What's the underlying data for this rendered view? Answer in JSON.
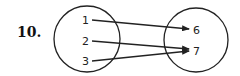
{
  "problem_number": "10.",
  "domain_set": {
    "elements": [
      "1",
      "2",
      "3"
    ]
  },
  "range_set": {
    "elements": [
      "6",
      "7"
    ]
  },
  "mapping": [
    {
      "from": "1",
      "to": "6"
    },
    {
      "from": "2",
      "to": "7"
    },
    {
      "from": "3",
      "to": "7"
    }
  ],
  "colors": {
    "stroke": "#222222",
    "background": "#ffffff"
  }
}
